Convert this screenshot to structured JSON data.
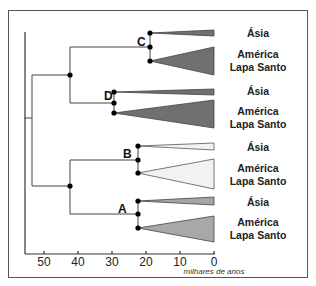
{
  "figure": {
    "x_axis": {
      "label": "milhares de anos",
      "ticks": [
        "50",
        "40",
        "30",
        "20",
        "10",
        "0"
      ]
    },
    "nodes": [
      "C",
      "D",
      "B",
      "A"
    ],
    "clades": [
      {
        "node": "C",
        "tips": [
          {
            "label": "Ásia",
            "fill": "#707070"
          },
          {
            "label_line1": "América",
            "label_line2": "Lapa Santo",
            "fill": "#707070"
          }
        ]
      },
      {
        "node": "D",
        "tips": [
          {
            "label": "Ásia",
            "fill": "#707070"
          },
          {
            "label_line1": "América",
            "label_line2": "Lapa Santo",
            "fill": "#707070"
          }
        ]
      },
      {
        "node": "B",
        "tips": [
          {
            "label": "Ásia",
            "fill": "#f2f2f2"
          },
          {
            "label_line1": "América",
            "label_line2": "Lapa Santo",
            "fill": "#f2f2f2"
          }
        ]
      },
      {
        "node": "A",
        "tips": [
          {
            "label": "Ásia",
            "fill": "#a4a4a4"
          },
          {
            "label_line1": "América",
            "label_line2": "Lapa Santo",
            "fill": "#a8a8a8"
          }
        ]
      }
    ]
  }
}
